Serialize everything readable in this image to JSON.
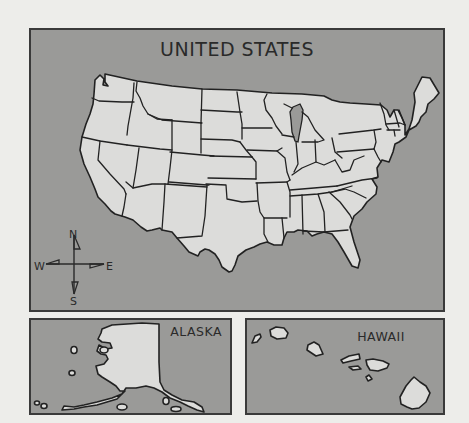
{
  "main_map": {
    "title": "UNITED STATES",
    "compass": {
      "north": "N",
      "south": "S",
      "east": "E",
      "west": "W"
    }
  },
  "alaska_inset": {
    "title": "ALASKA"
  },
  "hawaii_inset": {
    "title": "HAWAII"
  },
  "colors": {
    "background": "#ededea",
    "water": "#9a9a98",
    "land": "#dcdcda",
    "outline": "#222222"
  }
}
